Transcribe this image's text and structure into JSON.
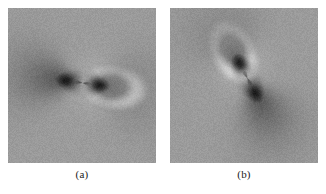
{
  "figure": {
    "background_color": "#ffffff",
    "panel_count": 2,
    "panels": [
      {
        "id": "a",
        "caption": "(a)",
        "description": "grayscale dipole field map, horizontal orientation",
        "x": 8,
        "y": 8,
        "width": 148,
        "height": 155,
        "background_gray": "#9b9b9b",
        "dipole": {
          "center_x": 0.5,
          "center_y": 0.48,
          "angle_deg": 8,
          "lobe_separation": 0.075,
          "dark_lobe_color": "#0d0d0d",
          "bright_lobe_color": "#f2f2f2",
          "bright_arc_side": "right",
          "strength": 1.0,
          "extent": 0.42
        }
      },
      {
        "id": "b",
        "caption": "(b)",
        "description": "grayscale dipole field map, rotated orientation",
        "x": 170,
        "y": 8,
        "width": 148,
        "height": 155,
        "background_gray": "#9b9b9b",
        "dipole": {
          "center_x": 0.52,
          "center_y": 0.45,
          "angle_deg": 62,
          "lobe_separation": 0.075,
          "dark_lobe_color": "#0d0d0d",
          "bright_lobe_color": "#f2f2f2",
          "bright_arc_side": "lower-left",
          "strength": 1.0,
          "extent": 0.42
        }
      }
    ],
    "noise_amount": 0.055,
    "colormap": "grayscale"
  },
  "chart_data": {
    "type": "heatmap",
    "title": "",
    "xlabel": "",
    "ylabel": "",
    "panels": [
      {
        "label": "(a)",
        "field": "dipole",
        "orientation_deg": 8,
        "dark_lobes": [
          {
            "position": "left-of-center",
            "x": 0.4,
            "y": 0.47,
            "value": -1.0
          },
          {
            "position": "right-of-center",
            "x": 0.62,
            "y": 0.5,
            "value": -1.0
          }
        ],
        "bright_region": {
          "position": "crescent-arc-right",
          "x": 0.76,
          "y": 0.42,
          "value": 0.85
        },
        "background_value": 0.0,
        "value_range": [
          -1.0,
          1.0
        ]
      },
      {
        "label": "(b)",
        "field": "dipole",
        "orientation_deg": 62,
        "dark_lobes": [
          {
            "position": "upper-right-of-center",
            "x": 0.56,
            "y": 0.33,
            "value": -1.0
          },
          {
            "position": "lower-left-of-center",
            "x": 0.47,
            "y": 0.58,
            "value": -1.0
          }
        ],
        "bright_region": {
          "position": "crescent-arc-lower-left",
          "x": 0.38,
          "y": 0.74,
          "value": 0.85
        },
        "background_value": 0.0,
        "value_range": [
          -1.0,
          1.0
        ]
      }
    ],
    "grid": false,
    "legend": "none",
    "colormap": "gray"
  }
}
